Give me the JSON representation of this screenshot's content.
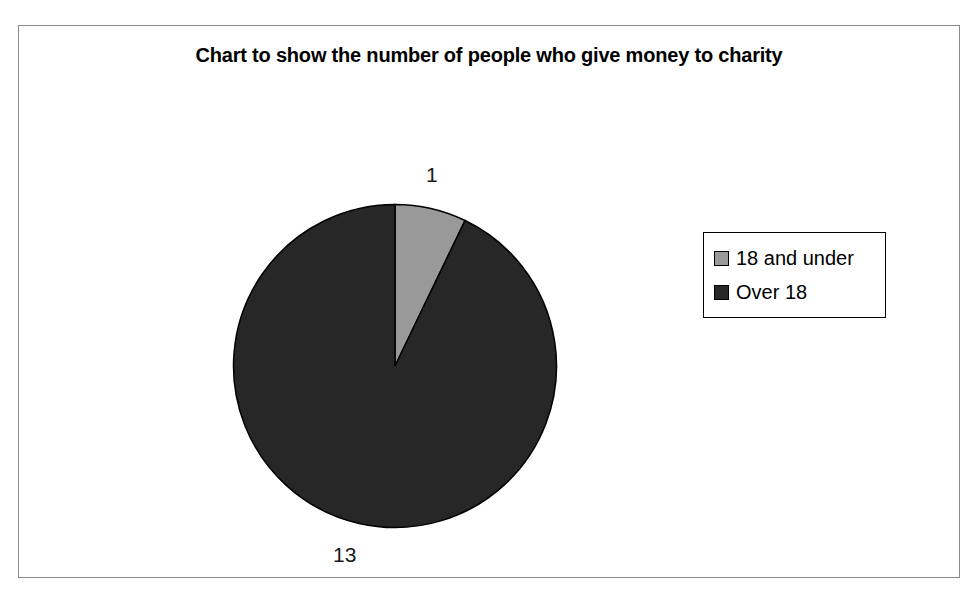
{
  "chart_data": {
    "type": "pie",
    "title": "Chart to show the number of people who give money to charity",
    "categories": [
      "18 and under",
      "Over 18"
    ],
    "values": [
      1,
      13
    ],
    "labels": [
      "1",
      "13"
    ],
    "total": 14,
    "colors": [
      "#999999",
      "#272727"
    ],
    "legend_position": "right",
    "grid": false,
    "start_angle_deg": 0,
    "direction": "clockwise",
    "slices": [
      {
        "name": "18 and under",
        "value": 1,
        "label": "1",
        "color": "#999999",
        "start_angle_deg": 0,
        "sweep_angle_deg": 25.714
      },
      {
        "name": "Over 18",
        "value": 13,
        "label": "13",
        "color": "#272727",
        "start_angle_deg": 25.714,
        "sweep_angle_deg": 334.286
      }
    ]
  },
  "frame": {
    "border_color": "#8a8a8a"
  },
  "legend": {
    "items": [
      {
        "label": "18 and under",
        "color": "#999999"
      },
      {
        "label": "Over 18",
        "color": "#272727"
      }
    ]
  }
}
